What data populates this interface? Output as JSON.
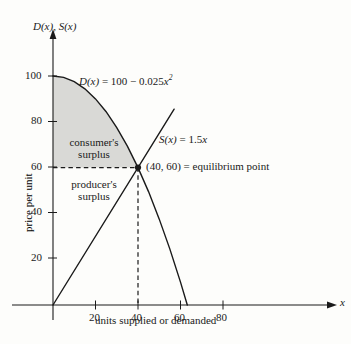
{
  "figure": {
    "background_color": "#fdfdfb",
    "ink_color": "#1a1a1a",
    "shade_color": "#d9d9d6"
  },
  "chart_data": {
    "type": "line",
    "title": "",
    "subtitle": "",
    "xlabel": "units supplied or demanded",
    "ylabel": "price per unit",
    "x_axis_name": "x",
    "y_axis_name": "D(x), S(x)",
    "xlim": [
      0,
      94
    ],
    "ylim": [
      0,
      116
    ],
    "xticks": [
      20,
      40,
      60,
      80
    ],
    "xtick_labels": [
      "20",
      "40",
      "60",
      "80"
    ],
    "yticks": [
      20,
      40,
      60,
      80,
      100
    ],
    "ytick_labels": [
      "20",
      "40",
      "60",
      "80",
      "100"
    ],
    "grid": false,
    "legend_position": "inline-annotations",
    "series": [
      {
        "name": "D(x) = 100 - 0.025x^2",
        "label": "D(x) = 100 − 0.025x²",
        "type": "curve",
        "equation": "100 - 0.025*x^2",
        "x_start": 0,
        "x_end": 63.2,
        "points": [
          [
            0,
            100
          ],
          [
            5,
            99.4
          ],
          [
            10,
            97.5
          ],
          [
            15,
            94.4
          ],
          [
            20,
            90
          ],
          [
            25,
            84.4
          ],
          [
            30,
            77.5
          ],
          [
            35,
            69.4
          ],
          [
            40,
            60
          ],
          [
            45,
            49.4
          ],
          [
            50,
            37.5
          ],
          [
            55,
            24.4
          ],
          [
            60,
            10
          ],
          [
            63.2,
            0
          ]
        ]
      },
      {
        "name": "S(x) = 1.5x",
        "label": "S(x) = 1.5x",
        "type": "line",
        "equation": "1.5*x",
        "x_start": 0,
        "x_end": 57,
        "points": [
          [
            0,
            0
          ],
          [
            57,
            85.5
          ]
        ]
      }
    ],
    "annotations": [
      {
        "name": "equilibrium-point",
        "label": "(40, 60) = equilibrium point",
        "x": 40,
        "y": 60,
        "marker": "dot"
      },
      {
        "name": "consumers-surplus-region",
        "label_line1": "consumer's",
        "label_line2": "surplus",
        "shaded": true,
        "description": "Region between D(x) and the line y=60, from x=0 to x=40"
      },
      {
        "name": "producers-surplus-region",
        "label_line1": "producer's",
        "label_line2": "surplus",
        "shaded": false,
        "description": "Region between the line y=60 and S(x), from x=0 to x=40"
      }
    ],
    "guides": [
      {
        "name": "horizontal-dashed-at-60",
        "orientation": "horizontal",
        "value": 60,
        "from": 0,
        "to": 40,
        "style": "dashed"
      },
      {
        "name": "vertical-dashed-at-40",
        "orientation": "vertical",
        "value": 40,
        "from": 0,
        "to": 60,
        "style": "dashed"
      }
    ]
  },
  "labels": {
    "y_axis_name": "D(x), S(x)",
    "x_axis_name": "x",
    "ylabel": "price per unit",
    "xlabel": "units supplied or demanded",
    "demand_label_fn": "D(x)",
    "demand_label_eq": " = 100 − 0.025",
    "demand_label_var": "x",
    "demand_label_exp": "2",
    "supply_label_fn": "S(x)",
    "supply_label_eq": " = 1.5",
    "supply_label_var": "x",
    "equilibrium_text": "(40, 60) = equilibrium point",
    "consumers_surplus_1": "consumer's",
    "consumers_surplus_2": "surplus",
    "producers_surplus_1": "producer's",
    "producers_surplus_2": "surplus",
    "xtick_20": "20",
    "xtick_40": "40",
    "xtick_60": "60",
    "xtick_80": "80",
    "ytick_20": "20",
    "ytick_40": "40",
    "ytick_60": "60",
    "ytick_80": "80",
    "ytick_100": "100"
  }
}
